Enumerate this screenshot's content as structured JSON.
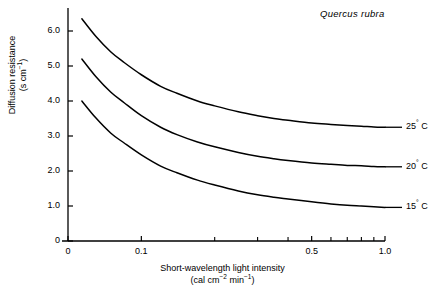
{
  "figure": {
    "annotation": "Quercus rubra",
    "background_color": "#ffffff",
    "line_color": "#000000"
  },
  "chart_data": {
    "type": "line",
    "title": "",
    "annotation": "Quercus rubra",
    "xlabel_line1": "Short-wavelength light intensity",
    "xlabel_line2_prefix": "(cal cm",
    "xlabel_line2_sup1": "−2",
    "xlabel_line2_mid": " min",
    "xlabel_line2_sup2": "−1",
    "xlabel_line2_suffix": ")",
    "ylabel_line1": "Diffusion resistance",
    "ylabel_line2_prefix": "(s cm",
    "ylabel_line2_sup": "−1",
    "ylabel_line2_suffix": ")",
    "xscale": "log",
    "xlim": [
      0.05,
      1.0
    ],
    "ylim": [
      0,
      6.6
    ],
    "grid": false,
    "legend_position": "right-inline",
    "x_tick_labels": [
      "0",
      "0.1",
      "0.5",
      "1.0"
    ],
    "x_tick_values": [
      0.05,
      0.1,
      0.5,
      1.0
    ],
    "x_minor_ticks": [
      0.2,
      0.3,
      0.4,
      0.6,
      0.7,
      0.8,
      0.9
    ],
    "y_tick_labels": [
      "0",
      "1.0",
      "2.0",
      "3.0",
      "4.0",
      "5.0",
      "6.0"
    ],
    "y_tick_values": [
      0,
      1.0,
      2.0,
      3.0,
      4.0,
      5.0,
      6.0
    ],
    "series": [
      {
        "name": "25° C",
        "label": "25",
        "degree": "°",
        "unit": " C",
        "asymptote": 3.25,
        "start_x": 0.057,
        "start_y": 6.35,
        "x": [
          0.057,
          0.065,
          0.075,
          0.085,
          0.1,
          0.12,
          0.14,
          0.17,
          0.2,
          0.25,
          0.3,
          0.35,
          0.4,
          0.5,
          0.6,
          0.7,
          0.8,
          0.9,
          1.0
        ],
        "y": [
          6.35,
          5.85,
          5.4,
          5.1,
          4.75,
          4.42,
          4.22,
          4.0,
          3.86,
          3.69,
          3.58,
          3.5,
          3.45,
          3.37,
          3.33,
          3.3,
          3.28,
          3.26,
          3.25
        ]
      },
      {
        "name": "20° C",
        "label": "20",
        "degree": "°",
        "unit": " C",
        "asymptote": 2.12,
        "start_x": 0.057,
        "start_y": 5.2,
        "x": [
          0.057,
          0.065,
          0.075,
          0.085,
          0.1,
          0.12,
          0.14,
          0.17,
          0.2,
          0.25,
          0.3,
          0.35,
          0.4,
          0.5,
          0.6,
          0.7,
          0.8,
          0.9,
          1.0
        ],
        "y": [
          5.2,
          4.7,
          4.25,
          3.95,
          3.58,
          3.25,
          3.04,
          2.83,
          2.69,
          2.53,
          2.42,
          2.35,
          2.3,
          2.23,
          2.19,
          2.16,
          2.15,
          2.13,
          2.12
        ]
      },
      {
        "name": "15° C",
        "label": "15",
        "degree": "°",
        "unit": " C",
        "asymptote": 0.96,
        "start_x": 0.057,
        "start_y": 4.0,
        "x": [
          0.057,
          0.065,
          0.075,
          0.085,
          0.1,
          0.12,
          0.14,
          0.17,
          0.2,
          0.25,
          0.3,
          0.35,
          0.4,
          0.5,
          0.6,
          0.7,
          0.8,
          0.9,
          1.0
        ],
        "y": [
          4.0,
          3.52,
          3.08,
          2.8,
          2.46,
          2.14,
          1.95,
          1.74,
          1.6,
          1.43,
          1.32,
          1.25,
          1.2,
          1.12,
          1.06,
          1.02,
          1.0,
          0.98,
          0.96
        ]
      }
    ]
  }
}
